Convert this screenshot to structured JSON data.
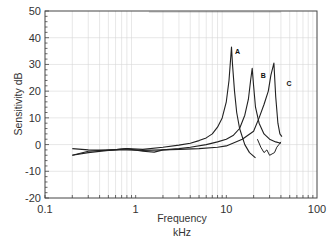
{
  "chart_data": {
    "type": "line",
    "title": "",
    "xlabel": "Frequency",
    "xunit": "kHz",
    "ylabel": "Sensitivity  dB",
    "xscale": "log",
    "xlim": [
      0.1,
      100
    ],
    "ylim": [
      -20,
      50
    ],
    "x_ticks": [
      0.1,
      1,
      10,
      100
    ],
    "x_tick_labels": [
      "0.1",
      "1",
      "10",
      "100"
    ],
    "y_ticks": [
      -20,
      -10,
      0,
      10,
      20,
      30,
      40,
      50
    ],
    "y_tick_labels": [
      "-20",
      "-10",
      "0",
      "10",
      "20",
      "30",
      "40",
      "50"
    ],
    "grid": true,
    "legend": "inline labels A, B, C near peaks",
    "series": [
      {
        "name": "A",
        "label_pos": [
          12.5,
          34
        ],
        "x": [
          0.2,
          0.3,
          0.5,
          0.8,
          1.2,
          2,
          3,
          4,
          5,
          6,
          7,
          8,
          9,
          10,
          10.7,
          11.2,
          11.4,
          11.7,
          12.3,
          13,
          14,
          16,
          18,
          21
        ],
        "y": [
          -1.5,
          -2.0,
          -2.2,
          -1.5,
          -1.8,
          -1.0,
          -0.2,
          0.5,
          1.5,
          2.5,
          4.0,
          6.5,
          10.0,
          16.0,
          24.0,
          33.0,
          36.5,
          30.0,
          20.0,
          12.0,
          6.0,
          0.0,
          -3.0,
          -5.0
        ]
      },
      {
        "name": "B",
        "label_pos": [
          24,
          25
        ],
        "x": [
          0.2,
          0.3,
          0.5,
          0.8,
          1.2,
          1.6,
          2,
          3,
          4,
          6,
          8,
          10,
          12,
          14,
          16,
          17.5,
          18.5,
          19.3,
          20,
          21,
          23,
          26,
          30,
          35,
          40
        ],
        "y": [
          -4.0,
          -3.0,
          -2.2,
          -1.5,
          -2.5,
          -2.8,
          -2.0,
          -1.5,
          -1.0,
          0.0,
          1.0,
          2.0,
          3.5,
          6.0,
          11.0,
          17.0,
          24.0,
          28.5,
          22.0,
          14.0,
          8.0,
          4.0,
          2.0,
          1.0,
          0.5
        ]
      },
      {
        "name": "C",
        "label_pos": [
          46,
          22
        ],
        "x": [
          0.2,
          0.3,
          0.5,
          0.8,
          1.2,
          2,
          3,
          5,
          8,
          10,
          15,
          20,
          23,
          26,
          29,
          31,
          33.5,
          35,
          37,
          39,
          41
        ],
        "y": [
          -4.0,
          -2.5,
          -2.0,
          -2.0,
          -2.2,
          -2.0,
          -1.8,
          -1.5,
          -1.0,
          -0.5,
          2.0,
          5.0,
          10.0,
          15.0,
          20.0,
          26.0,
          30.5,
          18.0,
          8.0,
          4.0,
          3.0
        ]
      }
    ],
    "extra_segments": {
      "C_dip": {
        "x": [
          22,
          24,
          26,
          28,
          30,
          32,
          34,
          36,
          38,
          40
        ],
        "y": [
          2.0,
          -1.0,
          -3.0,
          -2.0,
          -4.0,
          -3.5,
          -3.0,
          -1.0,
          0.0,
          1.0
        ]
      }
    }
  },
  "axes": {
    "x_title_line1": "Frequency",
    "x_title_line2": "kHz",
    "y_title": "Sensitivity  dB"
  }
}
